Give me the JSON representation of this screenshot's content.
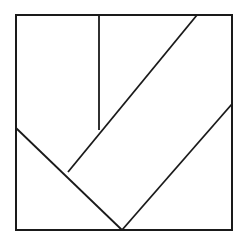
{
  "figure": {
    "type": "geometric-line-diagram",
    "background_color": "#ffffff",
    "stroke_color": "#1a1a1a",
    "fill_color": "#ffffff",
    "canvas": {
      "width": 245,
      "height": 241
    },
    "outline_stroke_width": 2.0,
    "cut_stroke_width": 1.8
  },
  "chart_data": {
    "type": "diagram",
    "xlabel": "",
    "ylabel": "",
    "xlim": [
      0,
      245
    ],
    "ylim": [
      0,
      241
    ],
    "grid": false,
    "legend": "none",
    "square": {
      "name": "outer-square",
      "top_left": [
        16,
        15
      ],
      "top_right": [
        232,
        15
      ],
      "bottom_right": [
        232,
        230
      ],
      "bottom_left": [
        16,
        230
      ],
      "width": 216,
      "height": 215
    },
    "vertices": {
      "A_top_left": [
        16,
        15
      ],
      "B_top_diag": [
        197,
        15
      ],
      "C_top_right": [
        232,
        15
      ],
      "D_right_mid": [
        232,
        104
      ],
      "E_bottom_right": [
        232,
        230
      ],
      "F_bottom_apex": [
        122,
        230
      ],
      "G_bottom_left": [
        16,
        230
      ],
      "H_left_mid": [
        16,
        128
      ],
      "I_inner_junction": [
        68,
        172
      ],
      "J_vertical_foot": [
        99,
        130
      ],
      "K_vertical_top": [
        99,
        15
      ]
    },
    "segments": [
      {
        "name": "square-top-edge",
        "from": [
          16,
          15
        ],
        "to": [
          232,
          15
        ]
      },
      {
        "name": "square-right-edge",
        "from": [
          232,
          15
        ],
        "to": [
          232,
          230
        ]
      },
      {
        "name": "square-bottom-edge",
        "from": [
          232,
          230
        ],
        "to": [
          16,
          230
        ]
      },
      {
        "name": "square-left-edge",
        "from": [
          16,
          230
        ],
        "to": [
          16,
          15
        ]
      },
      {
        "name": "vertical-cut",
        "from": [
          99,
          15
        ],
        "to": [
          99,
          130
        ]
      },
      {
        "name": "long-diagonal-cut",
        "from": [
          197,
          15
        ],
        "to": [
          68,
          172
        ]
      },
      {
        "name": "left-diagonal-cut",
        "from": [
          16,
          128
        ],
        "to": [
          122,
          230
        ]
      },
      {
        "name": "right-diagonal-cut",
        "from": [
          122,
          230
        ],
        "to": [
          232,
          104
        ]
      }
    ],
    "pieces": [
      {
        "name": "piece-top-left-rectangle",
        "polygon": [
          [
            16,
            15
          ],
          [
            99,
            15
          ],
          [
            99,
            130
          ],
          [
            68,
            172
          ],
          [
            16,
            128
          ]
        ]
      },
      {
        "name": "piece-parallelogram",
        "polygon": [
          [
            99,
            15
          ],
          [
            197,
            15
          ],
          [
            122,
            230
          ],
          [
            68,
            172
          ]
        ]
      },
      {
        "name": "piece-lower-left-triangle",
        "polygon": [
          [
            16,
            128
          ],
          [
            68,
            172
          ],
          [
            122,
            230
          ],
          [
            16,
            230
          ]
        ]
      },
      {
        "name": "piece-right-region",
        "polygon": [
          [
            197,
            15
          ],
          [
            232,
            15
          ],
          [
            232,
            104
          ],
          [
            122,
            230
          ]
        ]
      },
      {
        "name": "piece-bottom-right-triangle",
        "polygon": [
          [
            122,
            230
          ],
          [
            232,
            104
          ],
          [
            232,
            230
          ]
        ]
      }
    ],
    "counts": {
      "pieces": 5,
      "cut_lines": 4,
      "outline_edges": 4,
      "vertices": 11
    }
  }
}
